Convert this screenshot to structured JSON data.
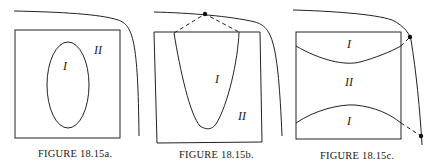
{
  "figures": [
    {
      "id": "a",
      "caption": "FIGURE 18.15a.",
      "regions": {
        "inner": "I",
        "outer": "II"
      },
      "description": "Square domain with an ellipse (region I) inside; region II is the rest of the square; a boundary curve bends around the upper-right outside the square."
    },
    {
      "id": "b",
      "caption": "FIGURE 18.15b.",
      "regions": {
        "inner": "I",
        "outer": "II"
      },
      "description": "Square domain with a U-shaped region I opening to the top edge; dashed lines connect the top corners of region I to a point on the boundary curve above."
    },
    {
      "id": "c",
      "caption": "FIGURE 18.15c.",
      "regions": {
        "top": "I",
        "middle": "II",
        "bottom": "I"
      },
      "description": "Square domain split by two curves into top region I, middle region II and bottom region I; dashed lines connect the right ends of the curves to two points on the boundary curve."
    }
  ]
}
